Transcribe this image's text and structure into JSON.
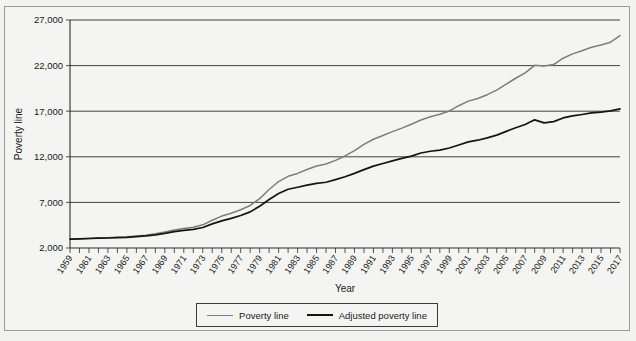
{
  "chart_data": {
    "type": "line",
    "title": "",
    "xlabel": "Year",
    "ylabel": "Poverty line",
    "xlim": [
      1959,
      2017
    ],
    "ylim": [
      2000,
      27000
    ],
    "yticks": [
      2000,
      7000,
      12000,
      17000,
      22000,
      27000
    ],
    "ytick_labels": [
      "2,000",
      "7,000",
      "12,000",
      "17,000",
      "22,000",
      "27,000"
    ],
    "grid": true,
    "legend_position": "bottom-center",
    "x": [
      1959,
      1960,
      1961,
      1962,
      1963,
      1964,
      1965,
      1966,
      1967,
      1968,
      1969,
      1970,
      1971,
      1972,
      1973,
      1974,
      1975,
      1976,
      1977,
      1978,
      1979,
      1980,
      1981,
      1982,
      1983,
      1984,
      1985,
      1986,
      1987,
      1988,
      1989,
      1990,
      1991,
      1992,
      1993,
      1994,
      1995,
      1996,
      1997,
      1998,
      1999,
      2000,
      2001,
      2002,
      2003,
      2004,
      2005,
      2006,
      2007,
      2008,
      2009,
      2010,
      2011,
      2012,
      2013,
      2014,
      2015,
      2016,
      2017
    ],
    "xtick_labels": [
      "1959",
      "1961",
      "1963",
      "1965",
      "1967",
      "1969",
      "1971",
      "1973",
      "1975",
      "1977",
      "1979",
      "1981",
      "1983",
      "1985",
      "1987",
      "1989",
      "1991",
      "1993",
      "1995",
      "1997",
      "1999",
      "2001",
      "2003",
      "2005",
      "2007",
      "2009",
      "2011",
      "2013",
      "2015",
      "2017"
    ],
    "series": [
      {
        "name": "Poverty line",
        "color": "#7d7d7d",
        "values": [
          2973,
          3022,
          3054,
          3100,
          3128,
          3169,
          3223,
          3317,
          3410,
          3553,
          3743,
          3968,
          4137,
          4275,
          4540,
          5038,
          5500,
          5815,
          6191,
          6662,
          7412,
          8414,
          9287,
          9862,
          10178,
          10609,
          10989,
          11203,
          11611,
          12092,
          12674,
          13359,
          13924,
          14335,
          14763,
          15141,
          15569,
          16036,
          16400,
          16660,
          17029,
          17603,
          18104,
          18392,
          18810,
          19307,
          19971,
          20614,
          21203,
          22025,
          21954,
          22113,
          22811,
          23283,
          23624,
          24008,
          24257,
          24563,
          25283
        ]
      },
      {
        "name": "Adjusted poverty line",
        "color": "#141414",
        "values": [
          2973,
          3010,
          3040,
          3075,
          3098,
          3130,
          3175,
          3250,
          3325,
          3440,
          3600,
          3800,
          3930,
          4040,
          4250,
          4640,
          4980,
          5250,
          5560,
          5960,
          6580,
          7310,
          7980,
          8440,
          8660,
          8890,
          9080,
          9210,
          9500,
          9810,
          10180,
          10590,
          10980,
          11260,
          11560,
          11830,
          12070,
          12420,
          12610,
          12740,
          12960,
          13300,
          13640,
          13820,
          14080,
          14380,
          14790,
          15180,
          15540,
          16050,
          15720,
          15860,
          16260,
          16490,
          16640,
          16810,
          16900,
          17040,
          17250
        ]
      }
    ]
  },
  "axis": {
    "y_title": "Poverty line",
    "x_title": "Year"
  },
  "legend": {
    "items": [
      {
        "label": "Poverty line",
        "swatch": "gray-line-swatch"
      },
      {
        "label": "Adjusted poverty line",
        "swatch": "black-line-swatch"
      }
    ]
  }
}
